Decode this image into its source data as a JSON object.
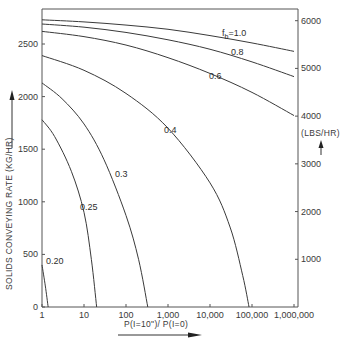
{
  "chart_data": {
    "type": "line",
    "title": "",
    "xlabel": "P(I=10\")/ P(I=0)",
    "ylabel": "SOLIDS CONVEYING RATE (KG/HR)",
    "ylabel_right": "(LBS/HR)",
    "xscale": "log",
    "xlim": [
      1,
      1000000
    ],
    "ylim": [
      0,
      2800
    ],
    "ylim_right": [
      0,
      6173
    ],
    "x_ticks": [
      1,
      10,
      100,
      1000,
      10000,
      100000,
      1000000
    ],
    "x_tick_labels": [
      "1",
      "10",
      "100",
      "1,000",
      "10,000",
      "100,000",
      "1,000,000"
    ],
    "y_ticks": [
      0,
      500,
      1000,
      1500,
      2000,
      2500
    ],
    "y_tick_labels": [
      "0",
      "500",
      "1000",
      "1500",
      "2000",
      "2500"
    ],
    "y_right_ticks": [
      1000,
      2000,
      3000,
      4000,
      5000,
      6000
    ],
    "y_right_tick_labels": [
      "1000",
      "2000",
      "3000",
      "4000",
      "5000",
      "6000"
    ],
    "grid": false,
    "legend": "inline curve labels",
    "parameter_name": "f_b",
    "series": [
      {
        "name": "f_b=1.0",
        "label": "f",
        "label_sub": "b",
        "label_rest": "=1.0",
        "x": [
          1,
          10,
          100,
          1000,
          10000,
          100000,
          1000000
        ],
        "y": [
          2730,
          2710,
          2680,
          2640,
          2580,
          2510,
          2430
        ]
      },
      {
        "name": "0.8",
        "label": "0.8",
        "x": [
          1,
          10,
          100,
          1000,
          10000,
          100000,
          1000000
        ],
        "y": [
          2690,
          2660,
          2610,
          2540,
          2450,
          2330,
          2190
        ]
      },
      {
        "name": "0.6",
        "label": "0.6",
        "x": [
          1,
          10,
          100,
          1000,
          10000,
          100000,
          1000000
        ],
        "y": [
          2620,
          2570,
          2490,
          2370,
          2220,
          2040,
          1820
        ]
      },
      {
        "name": "0.4",
        "label": "0.4",
        "x": [
          1,
          10,
          100,
          1000,
          10000,
          30000,
          60000,
          85000
        ],
        "y": [
          2390,
          2250,
          2030,
          1700,
          1180,
          760,
          300,
          0
        ]
      },
      {
        "name": "0.3",
        "label": "0.3",
        "x": [
          1,
          3,
          10,
          30,
          100,
          200,
          330
        ],
        "y": [
          2130,
          1980,
          1740,
          1400,
          870,
          450,
          0
        ]
      },
      {
        "name": "0.25",
        "label": "0.25",
        "x": [
          1,
          2,
          5,
          10,
          15,
          20
        ],
        "y": [
          1780,
          1620,
          1290,
          900,
          450,
          0
        ]
      },
      {
        "name": "0.20",
        "label": "0.20",
        "x": [
          1,
          1.2,
          1.4
        ],
        "y": [
          400,
          200,
          0
        ]
      }
    ],
    "annotations": [
      "up arrow next to left axis label",
      "up arrow under (LBS/HR)",
      "right arrow under x-axis label"
    ]
  }
}
